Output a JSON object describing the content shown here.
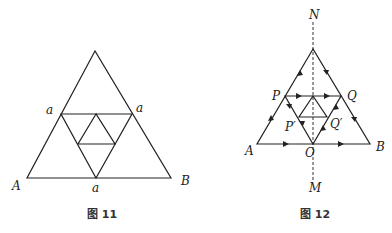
{
  "figure11": {
    "caption": "图 11",
    "labels": {
      "A": "A",
      "B": "B",
      "left_mid": "a",
      "right_mid": "a",
      "bottom_mid": "a"
    }
  },
  "figure12": {
    "caption": "图 12",
    "labels": {
      "N": "N",
      "M": "M",
      "A": "A",
      "B": "B",
      "P": "P",
      "Q": "Q",
      "P_prime": "P′",
      "Q_prime": "Q′",
      "O": "O"
    }
  }
}
